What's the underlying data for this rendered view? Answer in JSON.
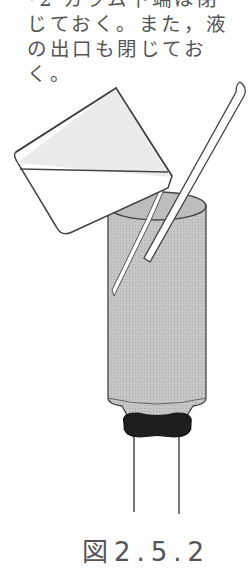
{
  "note": {
    "lines": [
      "*2 カラム下端は閉",
      "じておく。また，液",
      "の出口も閉じてお",
      "く。"
    ]
  },
  "figure": {
    "elements": [
      "beaker",
      "glass-rod",
      "column",
      "stopcock-ring",
      "outlet-tube"
    ],
    "colors": {
      "outline": "#444444",
      "column_fill": "#bdbdbd",
      "beaker_liquid": "#ebebeb",
      "ring": "#1e1e1e"
    }
  },
  "caption": "図2.5.2"
}
